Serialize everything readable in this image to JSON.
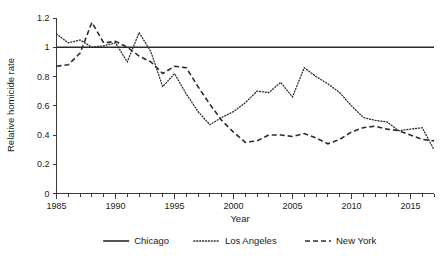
{
  "chart_data": {
    "type": "line",
    "title": "",
    "xlabel": "Year",
    "ylabel": "Relative homicide rate",
    "xlim": [
      1985,
      2017
    ],
    "ylim": [
      0,
      1.2
    ],
    "grid": false,
    "legend_position": "bottom",
    "x_tick_labels": [
      "1985",
      "1990",
      "1995",
      "2000",
      "2005",
      "2010",
      "2015"
    ],
    "x_tick_values": [
      1985,
      1990,
      1995,
      2000,
      2005,
      2010,
      2015
    ],
    "x_minor_tick_step": 1,
    "y_tick_labels": [
      "0",
      "0.2",
      "0.4",
      "0.6",
      "0.8",
      "1",
      "1.2"
    ],
    "y_tick_values": [
      0,
      0.2,
      0.4,
      0.6,
      0.8,
      1.0,
      1.2
    ],
    "x": [
      1985,
      1986,
      1987,
      1988,
      1989,
      1990,
      1991,
      1992,
      1993,
      1994,
      1995,
      1996,
      1997,
      1998,
      1999,
      2000,
      2001,
      2002,
      2003,
      2004,
      2005,
      2006,
      2007,
      2008,
      2009,
      2010,
      2011,
      2012,
      2013,
      2014,
      2015,
      2016,
      2017
    ],
    "series": [
      {
        "name": "Chicago",
        "style": "solid",
        "color": "#2b2b2b",
        "values": [
          1.0,
          1.0,
          1.0,
          1.0,
          1.0,
          1.0,
          1.0,
          1.0,
          1.0,
          1.0,
          1.0,
          1.0,
          1.0,
          1.0,
          1.0,
          1.0,
          1.0,
          1.0,
          1.0,
          1.0,
          1.0,
          1.0,
          1.0,
          1.0,
          1.0,
          1.0,
          1.0,
          1.0,
          1.0,
          1.0,
          1.0,
          1.0,
          1.0
        ]
      },
      {
        "name": "Los Angeles",
        "style": "dotted",
        "color": "#2b2b2b",
        "values": [
          1.09,
          1.03,
          1.05,
          1.0,
          1.01,
          1.03,
          0.9,
          1.1,
          0.97,
          0.73,
          0.82,
          0.68,
          0.56,
          0.47,
          0.52,
          0.56,
          0.62,
          0.7,
          0.69,
          0.76,
          0.66,
          0.86,
          0.8,
          0.75,
          0.69,
          0.6,
          0.52,
          0.5,
          0.49,
          0.43,
          0.44,
          0.45,
          0.3
        ]
      },
      {
        "name": "New York",
        "style": "dashed",
        "color": "#2b2b2b",
        "values": [
          0.87,
          0.88,
          0.96,
          1.17,
          1.03,
          1.04,
          1.0,
          0.94,
          0.9,
          0.82,
          0.87,
          0.86,
          0.73,
          0.61,
          0.5,
          0.42,
          0.35,
          0.36,
          0.4,
          0.4,
          0.39,
          0.41,
          0.38,
          0.34,
          0.37,
          0.42,
          0.45,
          0.46,
          0.44,
          0.43,
          0.4,
          0.37,
          0.36
        ]
      }
    ]
  },
  "axes": {
    "x_title": "Year",
    "y_title": "Relative homicide rate"
  },
  "legend": {
    "items": [
      {
        "label": "Chicago",
        "style": "solid"
      },
      {
        "label": "Los Angeles",
        "style": "dotted"
      },
      {
        "label": "New York",
        "style": "dashed"
      }
    ]
  }
}
